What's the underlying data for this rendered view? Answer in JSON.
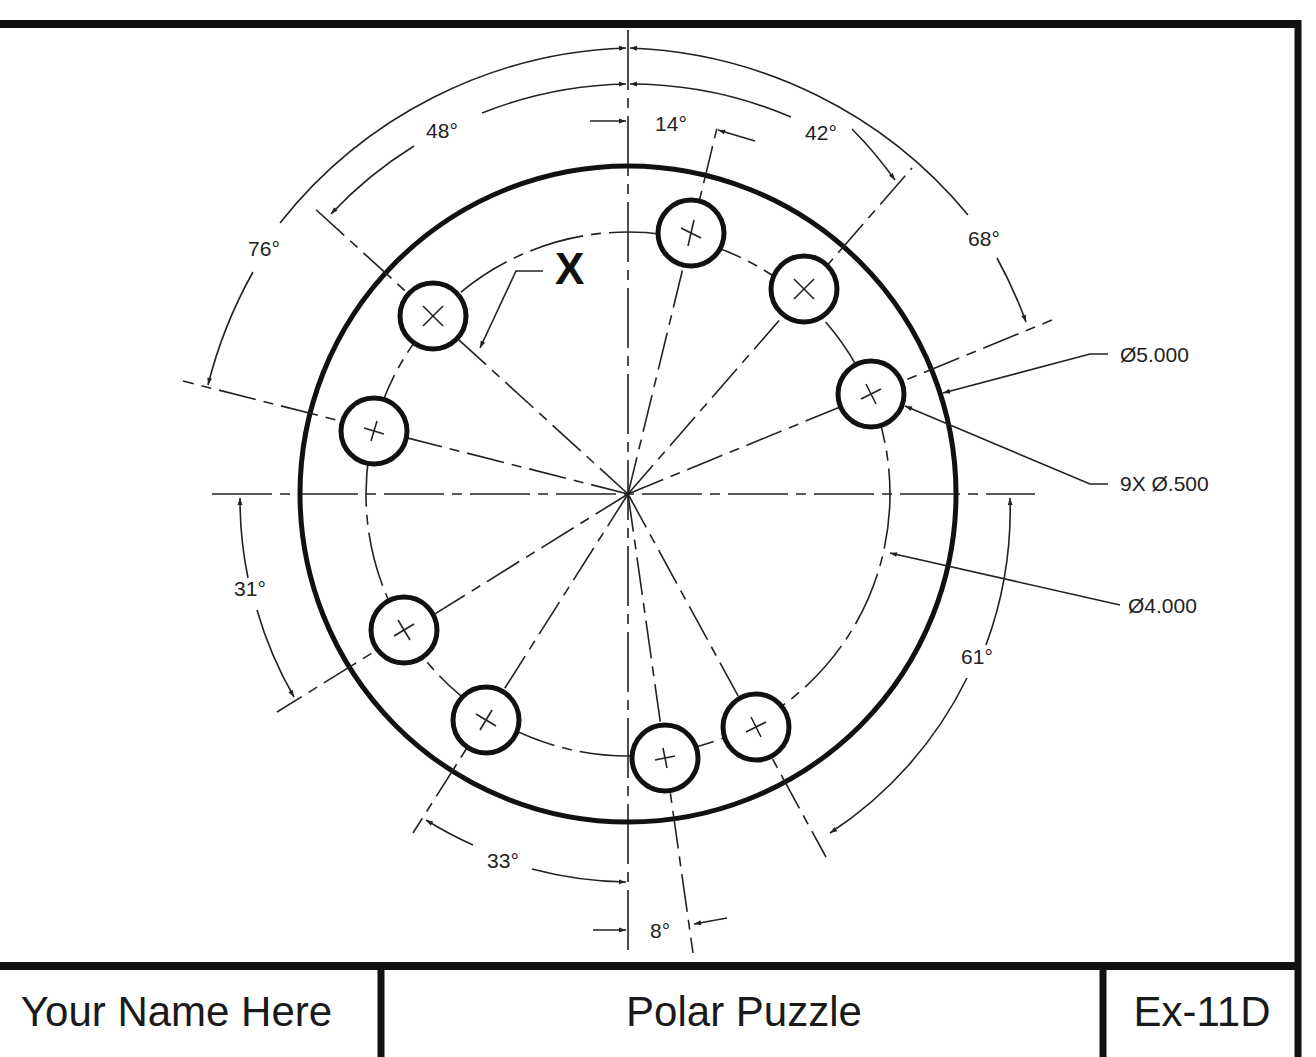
{
  "title_block": {
    "name": "Your Name Here",
    "title": "Polar Puzzle",
    "exercise": "Ex-11D"
  },
  "drawing": {
    "center": {
      "x": 628,
      "y": 494
    },
    "outer_circle": {
      "label": "Ø5.000",
      "radius_px": 328
    },
    "bolt_circle": {
      "label": "Ø4.000",
      "radius_px": 262
    },
    "holes": {
      "label": "9X Ø.500",
      "count": 9,
      "radius_px": 33
    },
    "unknown_label": "X",
    "angle_dimensions": [
      {
        "label": "14°",
        "x": 671,
        "y": 131
      },
      {
        "label": "48°",
        "x": 442,
        "y": 138
      },
      {
        "label": "42°",
        "x": 821,
        "y": 140
      },
      {
        "label": "76°",
        "x": 264,
        "y": 256
      },
      {
        "label": "68°",
        "x": 984,
        "y": 246
      },
      {
        "label": "31°",
        "x": 250,
        "y": 596
      },
      {
        "label": "61°",
        "x": 977,
        "y": 664
      },
      {
        "label": "33°",
        "x": 503,
        "y": 868
      },
      {
        "label": "8°",
        "x": 660,
        "y": 938
      }
    ],
    "callouts": [
      {
        "label": "Ø5.000",
        "x": 1120,
        "y": 362
      },
      {
        "label": "9X Ø.500",
        "x": 1120,
        "y": 491
      },
      {
        "label": "Ø4.000",
        "x": 1128,
        "y": 613
      }
    ]
  }
}
